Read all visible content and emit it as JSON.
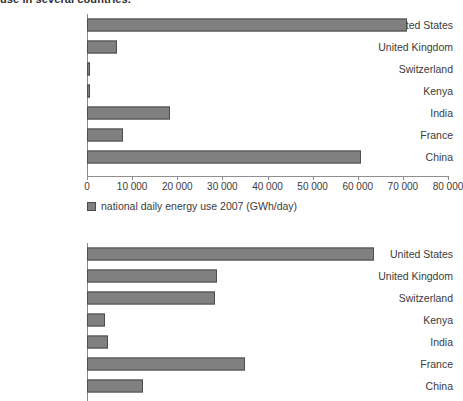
{
  "page": {
    "top_caption": "use in several countries."
  },
  "chart_data": [
    {
      "type": "bar",
      "orientation": "horizontal",
      "id": "chart-1",
      "title": "",
      "xlabel": "",
      "ylabel": "",
      "categories": [
        "United States",
        "United Kingdom",
        "Switzerland",
        "Kenya",
        "India",
        "France",
        "China"
      ],
      "values": [
        71000,
        6700,
        650,
        600,
        18400,
        8000,
        60700
      ],
      "series": [
        {
          "name": "national daily energy use 2007 (GWh/day)",
          "values": [
            71000,
            6700,
            650,
            600,
            18400,
            8000,
            60700
          ]
        }
      ],
      "xlim": [
        0,
        80000
      ],
      "xticks": [
        0,
        10000,
        20000,
        30000,
        40000,
        50000,
        60000,
        70000,
        80000
      ],
      "xticklabels": [
        "0",
        "10 000",
        "20 000",
        "30 000",
        "40 000",
        "50 000",
        "60 000",
        "70 000",
        "80 000"
      ],
      "grid": false,
      "legend": {
        "position": "bottom-left",
        "entries": [
          "national daily energy use 2007 (GWh/day)"
        ]
      },
      "bar_color": "#808080",
      "bar_edge_color": "#4d4d4d"
    },
    {
      "type": "bar",
      "orientation": "horizontal",
      "id": "chart-2",
      "title": "",
      "xlabel": "",
      "ylabel": "",
      "categories": [
        "United States",
        "United Kingdom",
        "Switzerland",
        "Kenya",
        "India",
        "France",
        "China"
      ],
      "values": [
        63500,
        28900,
        28400,
        4000,
        4700,
        35100,
        12400
      ],
      "series": [
        {
          "name": "per capita daily energy use 2007 (kWh/day)",
          "values": [
            63500,
            28900,
            28400,
            4000,
            4700,
            35100,
            12400
          ]
        }
      ],
      "xlim": [
        0,
        80000
      ],
      "grid": false,
      "legend": {
        "position": "none",
        "entries": []
      },
      "bar_color": "#808080",
      "bar_edge_color": "#4d4d4d"
    }
  ],
  "colors": {
    "bar_fill": "#808080",
    "bar_stroke": "#4d4d4d",
    "axis": "#8f8f8f",
    "text": "#3b3b3b",
    "background": "#ffffff"
  }
}
